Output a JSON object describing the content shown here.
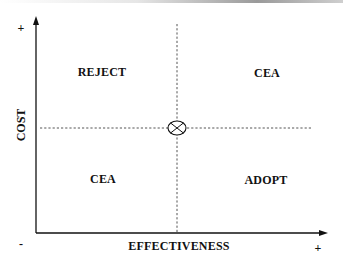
{
  "diagram": {
    "type": "cost-effectiveness plane",
    "axes": {
      "x_label": "EFFECTIVENESS",
      "y_label": "COST",
      "x_plus": "+",
      "y_plus": "+",
      "origin_minus": "-"
    },
    "quadrants": {
      "top_left": "REJECT",
      "top_right": "CEA",
      "bottom_left": "CEA",
      "bottom_right": "ADOPT"
    },
    "center_marker": "circled-x",
    "colors": {
      "axis": "#111111",
      "dashed": "#555555",
      "background": "#ffffff"
    }
  }
}
